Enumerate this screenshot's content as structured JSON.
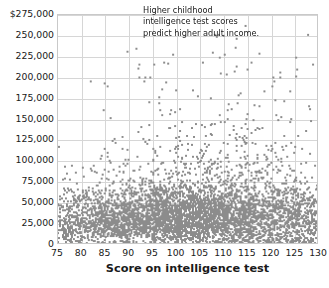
{
  "chart_data": {
    "type": "scatter",
    "title": "",
    "subtitle": "",
    "xlabel": "Score on intelligence test",
    "ylabel": "",
    "xlim": [
      75,
      130
    ],
    "ylim": [
      0,
      275000
    ],
    "grid": true,
    "legend": null,
    "point_color": "#8c8c8c",
    "x_ticks": [
      75,
      80,
      85,
      90,
      95,
      100,
      105,
      110,
      115,
      120,
      125,
      130
    ],
    "x_tick_labels": [
      "75",
      "80",
      "85",
      "90",
      "95",
      "100",
      "105",
      "110",
      "115",
      "120",
      "125",
      "130"
    ],
    "y_ticks": [
      0,
      25000,
      50000,
      75000,
      100000,
      125000,
      150000,
      175000,
      200000,
      225000,
      250000,
      275000
    ],
    "y_tick_labels": [
      "0",
      "25,000",
      "50,000",
      "75,000",
      "100,000",
      "125,000",
      "150,000",
      "175,000",
      "200,000",
      "225,000",
      "250,000",
      "275,000"
    ],
    "y_top_tick_label": "$275,000",
    "annotations": [
      {
        "text": "Higher childhood intelligence test scores predict higher adult income.",
        "x": 104,
        "y": 262000
      }
    ],
    "n_points": 2600,
    "notable_high_points": [
      {
        "x": 110.5,
        "y": 227000
      },
      {
        "x": 125.5,
        "y": 224000
      },
      {
        "x": 105.8,
        "y": 218000
      },
      {
        "x": 95.5,
        "y": 215000
      },
      {
        "x": 113.0,
        "y": 213000
      },
      {
        "x": 125.8,
        "y": 209000
      },
      {
        "x": 115.2,
        "y": 209000
      },
      {
        "x": 122.3,
        "y": 206000
      },
      {
        "x": 110.8,
        "y": 203000
      },
      {
        "x": 125.6,
        "y": 201000
      },
      {
        "x": 92.3,
        "y": 200000
      },
      {
        "x": 93.5,
        "y": 200000
      },
      {
        "x": 94.5,
        "y": 200000
      },
      {
        "x": 82.0,
        "y": 195000
      },
      {
        "x": 84.8,
        "y": 192000
      }
    ]
  },
  "axes": {
    "x_title": "Score on intelligence test"
  }
}
